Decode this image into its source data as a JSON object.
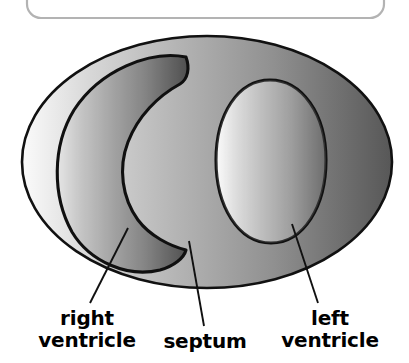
{
  "figure": {
    "title_alt": "cross-section of the heart showing ventricles and septum",
    "background_color": "#ffffff",
    "outline_color": "#000000",
    "top_panel": {
      "shape": "rounded-rectangle",
      "border_color": "#b3b3b3",
      "fill_color": "#ffffff",
      "visible_portion": "bottom edge only, clipped by image top"
    },
    "gradient": {
      "direction": "horizontal-left-to-right",
      "stops": [
        {
          "offset": "0%",
          "color": "#fbfbfb"
        },
        {
          "offset": "18%",
          "color": "#d8d8d8"
        },
        {
          "offset": "42%",
          "color": "#b4b4b4"
        },
        {
          "offset": "68%",
          "color": "#909090"
        },
        {
          "offset": "100%",
          "color": "#575757"
        }
      ]
    },
    "regions": [
      {
        "name": "myocardium-outer-ellipse",
        "description": "outer wall of the heart cross-section",
        "shape": "ellipse"
      },
      {
        "name": "right-ventricle-cavity",
        "description": "crescent shaped chamber on the left of the image",
        "shape": "crescent"
      },
      {
        "name": "left-ventricle-cavity",
        "description": "rounded oval chamber on the right of the image",
        "shape": "oval"
      },
      {
        "name": "septum-wall",
        "description": "muscular wall between the two ventricles",
        "shape": "band"
      }
    ],
    "labels": [
      {
        "id": "right-ventricle",
        "line1": "right",
        "line2": "ventricle",
        "full": "right ventricle",
        "leader_from": {
          "x": 128,
          "y": 228
        },
        "leader_to": {
          "x": 90,
          "y": 303
        }
      },
      {
        "id": "septum",
        "line1": "septum",
        "line2": "",
        "full": "septum",
        "leader_from": {
          "x": 189,
          "y": 241
        },
        "leader_to": {
          "x": 204,
          "y": 326
        }
      },
      {
        "id": "left-ventricle",
        "line1": "left",
        "line2": "ventricle",
        "full": "left ventricle",
        "leader_from": {
          "x": 292,
          "y": 224
        },
        "leader_to": {
          "x": 318,
          "y": 303
        }
      }
    ]
  }
}
